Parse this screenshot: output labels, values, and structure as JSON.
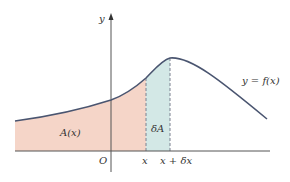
{
  "diagram": {
    "labels": {
      "y_axis": "y",
      "origin": "O",
      "x": "x",
      "x_plus_dx": "x + δx",
      "area": "A(x)",
      "delta_area": "δA",
      "curve": "y = f(x)"
    },
    "colors": {
      "curve": "#4a5570",
      "axis": "#555555",
      "area_fill": "#f5d5c8",
      "strip_fill": "#d3e8e6",
      "dash": "#7a8090"
    }
  }
}
